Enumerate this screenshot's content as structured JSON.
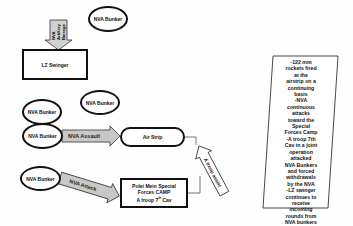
{
  "diagram": {
    "nodes": {
      "lz_swinger": "LZ Swinger",
      "bunker_top": "NVA Bunker",
      "bunker_left_mid": "NVA Bunker",
      "bunker_center_mid": "NVA Bunker",
      "bunker_assault": "NVA Bunker",
      "bunker_attack": "NVA Bunker",
      "air_strip": "Air Strip",
      "camp_line1": "Polei Mein Spectal",
      "camp_line2": "Forces CAMP",
      "camp_line3": "A troop 7",
      "camp_sup": "th",
      "camp_line3_end": " Cav"
    },
    "arrows": {
      "artillery": [
        "NVA",
        "Artillery",
        "Barrage"
      ],
      "assault": "NVA Assault",
      "attack": "NVA Attack",
      "troop_assist": "A troop assist"
    },
    "note": [
      "-122 mm",
      "rockets fired",
      "at the",
      "airstrip on a",
      "continuing",
      "basis",
      "-NVA",
      "continuous",
      "attacks",
      "toward the",
      "Special",
      "Forces Camp",
      "-A troop 7th",
      "Cav in a joint",
      "operation",
      "attacked",
      "NVA Bunkers",
      "and forced",
      "withdrawals",
      "by the NVA",
      "-LZ swinger",
      "continues to",
      "receive",
      "incoming",
      "rounds from",
      "NVA bunkers"
    ],
    "colors": {
      "stroke": "#111111",
      "arrow_fill": "#c8c8c8",
      "background": "#fefefe"
    }
  }
}
